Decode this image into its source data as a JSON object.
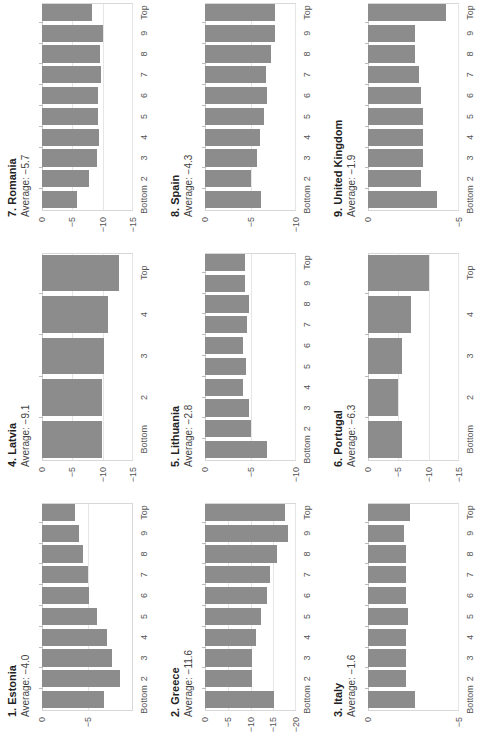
{
  "chart_data": [
    {
      "type": "bar",
      "title": "1. Estonia",
      "subtitle": "Average: −4.0",
      "categories": [
        "Bottom",
        "2",
        "3",
        "4",
        "5",
        "6",
        "7",
        "8",
        "9",
        "Top"
      ],
      "values": [
        -6.8,
        -8.6,
        -7.7,
        -7.1,
        -6.0,
        -5.2,
        -5.0,
        -4.5,
        -4.1,
        -3.6
      ],
      "ylim": [
        -10,
        0
      ],
      "yticks": [
        0,
        -5
      ],
      "xlabel": "",
      "ylabel": "",
      "grid": true
    },
    {
      "type": "bar",
      "title": "2. Greece",
      "subtitle": "Average: −11.6",
      "categories": [
        "Bottom",
        "2",
        "3",
        "4",
        "5",
        "6",
        "7",
        "8",
        "9",
        "Top"
      ],
      "values": [
        -15.1,
        -10.3,
        -10.4,
        -11.1,
        -12.3,
        -13.6,
        -14.2,
        -15.8,
        -18.2,
        -17.5
      ],
      "ylim": [
        -20,
        0
      ],
      "yticks": [
        0,
        -5,
        -10,
        -15,
        -20
      ],
      "xlabel": "",
      "ylabel": "",
      "grid": true
    },
    {
      "type": "bar",
      "title": "3. Italy",
      "subtitle": "Average: −1.6",
      "categories": [
        "Bottom",
        "2",
        "3",
        "4",
        "5",
        "6",
        "7",
        "8",
        "9",
        "Top"
      ],
      "values": [
        -2.6,
        -2.1,
        -2.1,
        -2.1,
        -2.2,
        -2.1,
        -2.1,
        -2.1,
        -2.0,
        -2.3
      ],
      "ylim": [
        -5,
        0
      ],
      "yticks": [
        0,
        -5
      ],
      "xlabel": "",
      "ylabel": "",
      "grid": true
    },
    {
      "type": "bar",
      "title": "4. Latvia",
      "subtitle": "Average: −9.1",
      "categories": [
        "Bottom",
        "2",
        "3",
        "4",
        "Top"
      ],
      "values": [
        -9.9,
        -9.9,
        -10.3,
        -10.8,
        -12.7
      ],
      "ylim": [
        -15,
        0
      ],
      "yticks": [
        0,
        -5,
        -10,
        -15
      ],
      "xlabel": "",
      "ylabel": "",
      "grid": true
    },
    {
      "type": "bar",
      "title": "5. Lithuania",
      "subtitle": "Average: −2.8",
      "categories": [
        "Bottom",
        "2",
        "3",
        "4",
        "5",
        "6",
        "7",
        "8",
        "9",
        "Top"
      ],
      "values": [
        -6.8,
        -5.0,
        -4.8,
        -4.2,
        -4.5,
        -4.2,
        -4.6,
        -4.8,
        -4.4,
        -4.4
      ],
      "ylim": [
        -10,
        0
      ],
      "yticks": [
        0,
        -5,
        -10
      ],
      "xlabel": "",
      "ylabel": "",
      "grid": true
    },
    {
      "type": "bar",
      "title": "6. Portugal",
      "subtitle": "Average: −6.3",
      "categories": [
        "Bottom",
        "2",
        "3",
        "4",
        "Top"
      ],
      "values": [
        -5.6,
        -5.0,
        -5.6,
        -7.1,
        -10.1
      ],
      "ylim": [
        -15,
        0
      ],
      "yticks": [
        0,
        -5,
        -10,
        -15
      ],
      "xlabel": "",
      "ylabel": "",
      "grid": true
    },
    {
      "type": "bar",
      "title": "7. Romania",
      "subtitle": "Average: −5.7",
      "categories": [
        "Bottom",
        "2",
        "3",
        "4",
        "5",
        "6",
        "7",
        "8",
        "9",
        "Top"
      ],
      "values": [
        -5.7,
        -7.8,
        -9.1,
        -9.4,
        -9.3,
        -9.3,
        -9.8,
        -9.6,
        -10.0,
        -8.3
      ],
      "ylim": [
        -15,
        0
      ],
      "yticks": [
        0,
        -5,
        -10,
        -15
      ],
      "xlabel": "",
      "ylabel": "",
      "grid": true
    },
    {
      "type": "bar",
      "title": "8. Spain",
      "subtitle": "Average: −4.3",
      "categories": [
        "Bottom",
        "2",
        "3",
        "4",
        "5",
        "6",
        "7",
        "8",
        "9",
        "Top"
      ],
      "values": [
        -6.1,
        -5.0,
        -5.7,
        -6.0,
        -6.5,
        -6.8,
        -6.7,
        -7.2,
        -7.7,
        -7.7
      ],
      "ylim": [
        -10,
        0
      ],
      "yticks": [
        0,
        -5,
        -10
      ],
      "xlabel": "",
      "ylabel": "",
      "grid": true
    },
    {
      "type": "bar",
      "title": "9. United Kingdom",
      "subtitle": "Average: −1.9",
      "categories": [
        "Bottom",
        "2",
        "3",
        "4",
        "5",
        "6",
        "7",
        "8",
        "9",
        "Top"
      ],
      "values": [
        -3.8,
        -2.9,
        -3.0,
        -3.0,
        -3.0,
        -2.9,
        -2.8,
        -2.6,
        -2.6,
        -4.3
      ],
      "ylim": [
        -5,
        0
      ],
      "yticks": [
        0,
        -5
      ],
      "xlabel": "",
      "ylabel": "",
      "grid": true
    }
  ],
  "layout": {
    "orientation": "rotated-90-ccw",
    "grid_columns": 3,
    "grid_rows": 3
  },
  "colors": {
    "bar": "#8c8c8c",
    "gridline": "#e6e6e6",
    "frame": "#d8d8d8",
    "text": "#333333"
  }
}
